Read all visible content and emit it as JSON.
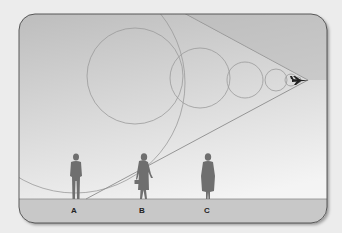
{
  "diagram": {
    "colors": {
      "page_background": "#ececec",
      "sky_top": "#bdbdbd",
      "sky_bottom": "#f2f2f2",
      "ground": "#c8c8c8",
      "panel_border": "#4a4a4a",
      "wave_lines": "#9a9a9a",
      "figures": "#6f6f6f",
      "aircraft": "#222222"
    },
    "aircraft": {
      "icon": "jet-aircraft-icon",
      "x": 303,
      "y": 80
    },
    "observers": [
      {
        "label": "A",
        "x": 76,
        "figure": "man-standing"
      },
      {
        "label": "B",
        "x": 143,
        "figure": "woman-with-briefcase"
      },
      {
        "label": "C",
        "x": 208,
        "figure": "woman-standing"
      }
    ]
  }
}
